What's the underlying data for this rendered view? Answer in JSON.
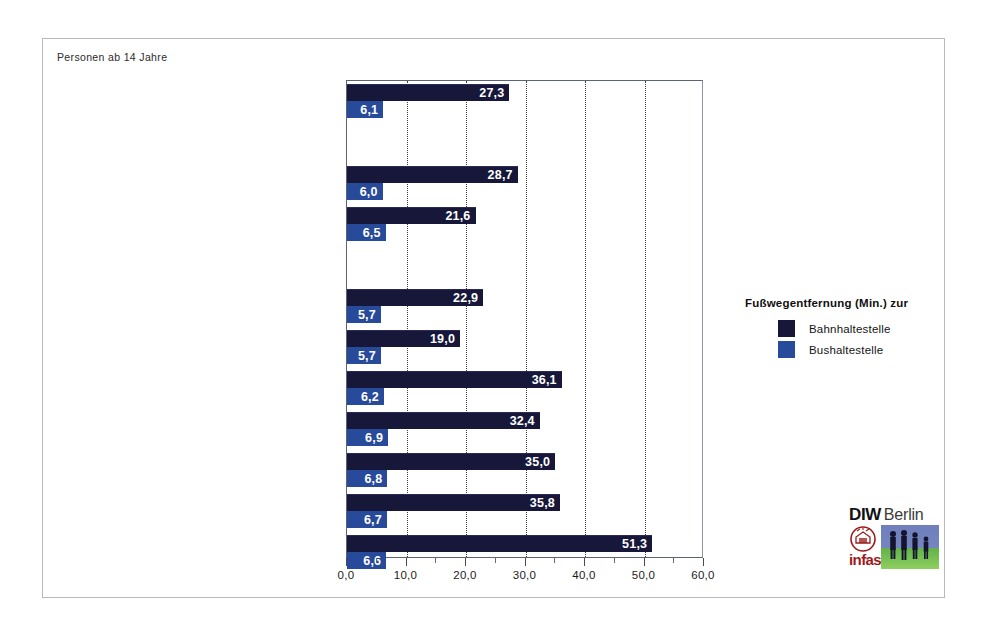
{
  "figure": {
    "top_caption": "Personen ab 14 Jahre",
    "source_note": "Quelle: MiD 2002"
  },
  "legend": {
    "title": "Fußwegentfernung (Min.) zur",
    "entries": [
      {
        "label": "Bahnhaltestelle",
        "color": "#17173a"
      },
      {
        "label": "Bushaltestelle",
        "color": "#274a9b"
      }
    ]
  },
  "logo": {
    "diw": "DIW",
    "berlin": "Berlin",
    "infas": "infas"
  },
  "chart_data": {
    "type": "bar",
    "orientation": "horizontal",
    "title": "",
    "subtitle": "Personen ab 14 Jahre",
    "xlabel": "",
    "ylabel": "",
    "xlim": [
      0.0,
      60.0
    ],
    "grid": true,
    "grid_axis": "x",
    "legend_position": "right",
    "xticks": [
      0.0,
      10.0,
      20.0,
      30.0,
      40.0,
      50.0,
      60.0
    ],
    "xticklabels": [
      "0,0",
      "10,0",
      "20,0",
      "30,0",
      "40,0",
      "50,0",
      "60,0"
    ],
    "categories": [
      "insgesamt",
      "West",
      "Ost",
      "hochverdichtete Agglomerationsräume",
      "Agglomerationsräume mit  Zentren",
      "verst. Räume höherer Dichte",
      "verst. Räume mittl. Dichte mit Oberzentren",
      "verst. Räume mittl. Dichte ohne Oberzentren",
      "ländliche Räume höherer Dichte",
      "ländliche Räume geringerer Dichte"
    ],
    "series": [
      {
        "name": "Bahnhaltestelle",
        "color": "#17173a",
        "values": [
          27.3,
          28.7,
          21.6,
          22.9,
          19.0,
          36.1,
          32.4,
          35.0,
          35.8,
          51.3
        ],
        "labels": [
          "27,3",
          "28,7",
          "21,6",
          "22,9",
          "19,0",
          "36,1",
          "32,4",
          "35,0",
          "35,8",
          "51,3"
        ]
      },
      {
        "name": "Bushaltestelle",
        "color": "#274a9b",
        "values": [
          6.1,
          6.0,
          6.5,
          5.7,
          5.7,
          6.2,
          6.9,
          6.8,
          6.7,
          6.6
        ],
        "labels": [
          "6,1",
          "6,0",
          "6,5",
          "5,7",
          "5,7",
          "6,2",
          "6,9",
          "6,8",
          "6,7",
          "6,6"
        ]
      }
    ]
  }
}
